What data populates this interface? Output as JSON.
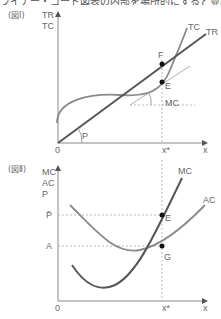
{
  "top_caption": "ライナー・コード図表の内部を場所的にすると並証差",
  "figure1": {
    "label": "(図Ⅰ)",
    "y_axis_label_1": "TR",
    "y_axis_label_2": "TC",
    "x_axis_label": "x",
    "origin_label": "0",
    "xstar_label": "x*",
    "curves": {
      "tr": "TR",
      "tc": "TC",
      "mc": "MC",
      "price_angle": "P"
    },
    "points": {
      "f": "F",
      "e": "E"
    }
  },
  "figure2": {
    "label": "(図Ⅱ)",
    "y_axis_label_1": "MC",
    "y_axis_label_2": "AC",
    "y_axis_label_3": "P",
    "x_axis_label": "x",
    "origin_label": "0",
    "xstar_label": "x*",
    "pbar_label": "P̄",
    "a_label": "A",
    "curves": {
      "mc": "MC",
      "ac": "AC"
    },
    "points": {
      "e": "E",
      "g": "G"
    }
  },
  "colors": {
    "axis": "#888888",
    "tr_line": "#555555",
    "tc_curve": "#8a8a8a",
    "mc_curve": "#555555",
    "ac_curve": "#8a8a8a",
    "dashed": "#aaaaaa",
    "point": "#111111",
    "text": "#666666"
  }
}
